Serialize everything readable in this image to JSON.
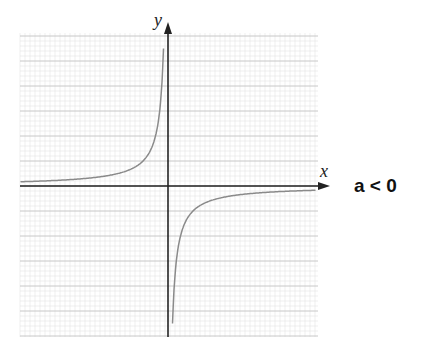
{
  "chart_data": {
    "type": "line",
    "title": "",
    "function": "y = a/x",
    "condition": "a < 0",
    "xlabel": "x",
    "ylabel": "y",
    "xlim": [
      -6,
      6
    ],
    "ylim": [
      -6,
      6
    ],
    "grid": true,
    "series": [
      {
        "name": "branch-left",
        "x": [
          -6,
          -4,
          -2,
          -1,
          -0.5,
          -0.3,
          -0.2
        ],
        "y": [
          0.17,
          0.25,
          0.5,
          1,
          2,
          3.3,
          5
        ]
      },
      {
        "name": "branch-right",
        "x": [
          0.2,
          0.3,
          0.5,
          1,
          2,
          4,
          6
        ],
        "y": [
          -5,
          -3.3,
          -2,
          -1,
          -0.5,
          -0.25,
          -0.17
        ]
      }
    ]
  },
  "labels": {
    "x": "x",
    "y": "y",
    "condition": "a < 0"
  },
  "colors": {
    "axis": "#222222",
    "curve": "#8a8a8a",
    "grid_major": "#c8c8c8",
    "grid_minor": "#e4e4e4"
  }
}
